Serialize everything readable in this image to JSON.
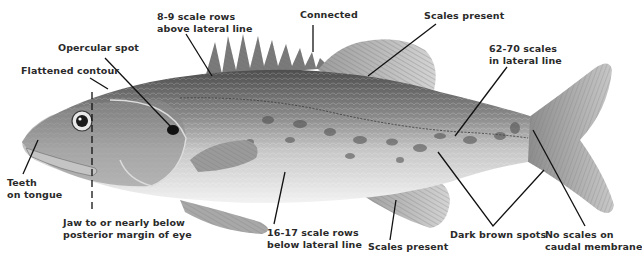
{
  "diagram": {
    "colors": {
      "background": "#ffffff",
      "body_dark": "#5a5a5a",
      "body_mid": "#9a9a9a",
      "body_light": "#e4e4e4",
      "fin": "#b8b8b8",
      "leader_line": "#111111",
      "label_text": "#2a2a2a"
    },
    "labels": [
      {
        "id": "scale-rows-above",
        "lines": [
          "8-9 scale rows",
          "above lateral line"
        ]
      },
      {
        "id": "connected",
        "lines": [
          "Connected"
        ]
      },
      {
        "id": "scales-present-top",
        "lines": [
          "Scales present"
        ]
      },
      {
        "id": "opercular-spot",
        "lines": [
          "Opercular spot"
        ]
      },
      {
        "id": "flattened-contour",
        "lines": [
          "Flattened contour"
        ]
      },
      {
        "id": "lateral-line-scales",
        "lines": [
          "62-70 scales",
          "in lateral line"
        ]
      },
      {
        "id": "teeth-on-tongue",
        "lines": [
          "Teeth",
          "on tongue"
        ]
      },
      {
        "id": "jaw",
        "lines": [
          "Jaw to or nearly below",
          "posterior margin of eye"
        ]
      },
      {
        "id": "scale-rows-below",
        "lines": [
          "16-17 scale rows",
          "below lateral line"
        ]
      },
      {
        "id": "scales-present-bottom",
        "lines": [
          "Scales present"
        ]
      },
      {
        "id": "dark-brown-spots",
        "lines": [
          "Dark brown spots"
        ]
      },
      {
        "id": "no-scales-caudal",
        "lines": [
          "No scales on",
          "caudal membrane"
        ]
      }
    ]
  }
}
